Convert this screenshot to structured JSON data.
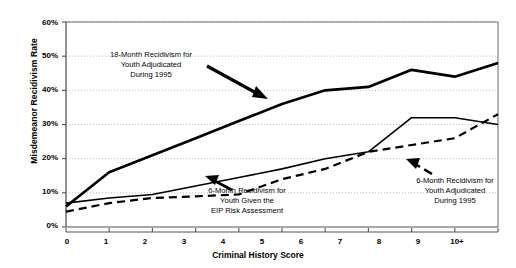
{
  "chart_data": {
    "type": "line",
    "title": "",
    "xlabel": "Criminal History Score",
    "ylabel": "Misdemeanor Recidivism Rate",
    "categories": [
      "0",
      "1",
      "2",
      "3",
      "4",
      "5",
      "6",
      "7",
      "8",
      "9",
      "10+"
    ],
    "ylim": [
      0,
      60
    ],
    "yticks": [
      "0%",
      "10%",
      "20%",
      "30%",
      "40%",
      "50%",
      "60%"
    ],
    "ytick_values": [
      0,
      10,
      20,
      30,
      40,
      50,
      60
    ],
    "grid": "horizontal-dotted",
    "legend": "none-inline-annotations",
    "series": [
      {
        "name": "18-Month Recidivism for Youth Adjudicated During 1995",
        "style": "solid-thick",
        "values": [
          6,
          16,
          21,
          26,
          31,
          36,
          40,
          41,
          46,
          44,
          48
        ]
      },
      {
        "name": "6-Month Recidivism for Youth Given the EIP Risk Assessment",
        "style": "solid-thin",
        "values": [
          7,
          8.5,
          9.5,
          12,
          14.5,
          17,
          20,
          22,
          32,
          32,
          30
        ]
      },
      {
        "name": "6-Month Recidivism for Youth Adjudicated During 1995",
        "style": "dashed",
        "values": [
          4.5,
          7,
          8.5,
          9,
          9.5,
          14,
          17,
          22,
          24,
          26,
          33
        ]
      }
    ],
    "annotations": [
      {
        "id": "annotation-18-month",
        "lines": [
          "18-Month Recidivism for",
          "Youth Adjudicated",
          "During 1995"
        ],
        "arrow": "points-down-right"
      },
      {
        "id": "annotation-eip",
        "lines": [
          "6-Month Recidivism for",
          "Youth Given the",
          "EIP Risk Assessment"
        ],
        "arrow": "points-up-left"
      },
      {
        "id": "annotation-6-month",
        "lines": [
          "6-Month Recidivism for",
          "Youth Adjudicated",
          "During 1995"
        ],
        "arrow": "points-up-left"
      }
    ],
    "colors": {
      "line": "#000000",
      "grid": "#bdbdbd",
      "axis": "#555555",
      "background": "#ffffff"
    }
  }
}
